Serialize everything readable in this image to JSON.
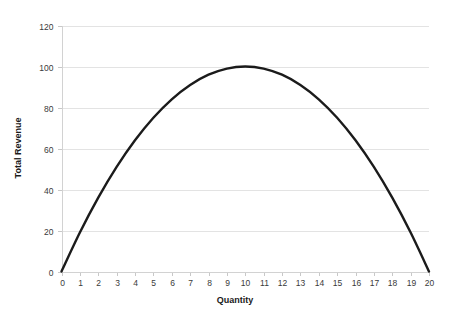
{
  "chart_data": {
    "type": "line",
    "title": "",
    "xlabel": "Quantity",
    "ylabel": "Total Revenue",
    "xlim": [
      0,
      20
    ],
    "ylim": [
      0,
      120
    ],
    "grid": true,
    "legend": null,
    "legend_position": "none",
    "x_ticks": [
      "0",
      "1",
      "2",
      "3",
      "4",
      "5",
      "6",
      "7",
      "8",
      "9",
      "10",
      "11",
      "12",
      "13",
      "14",
      "15",
      "16",
      "17",
      "18",
      "19",
      "20"
    ],
    "y_ticks": [
      "0",
      "20",
      "40",
      "60",
      "80",
      "100",
      "120"
    ],
    "series": [
      {
        "name": "Total Revenue",
        "color": "#1b1b1b",
        "x": [
          0,
          1,
          2,
          3,
          4,
          5,
          6,
          7,
          8,
          9,
          10,
          11,
          12,
          13,
          14,
          15,
          16,
          17,
          18,
          19,
          20
        ],
        "values": [
          0,
          19,
          36,
          51,
          64,
          75,
          84,
          91,
          96,
          99,
          100,
          99,
          96,
          91,
          84,
          75,
          64,
          51,
          36,
          19,
          0
        ]
      }
    ],
    "annotations": {
      "peak_quantity": "10",
      "peak_revenue": "100"
    },
    "colors": {
      "curve": "#1b1b1b",
      "gridline": "#e3e3e3",
      "axis": "#d2d2d2",
      "tick_text": "#3a3a3a",
      "axis_title": "#1a1a1a",
      "background": "#ffffff"
    }
  }
}
